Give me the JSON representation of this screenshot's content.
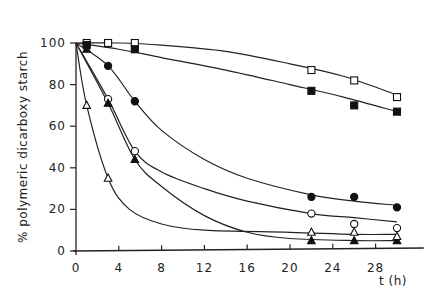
{
  "chart_data": {
    "type": "line",
    "title": "",
    "xlabel": "t (h)",
    "ylabel": "% polymeric dicarboxy starch",
    "xlim": [
      0,
      32
    ],
    "ylim": [
      0,
      100
    ],
    "x_ticks": [
      "0",
      "4",
      "8",
      "12",
      "16",
      "20",
      "24",
      "28"
    ],
    "y_ticks": [
      "0",
      "20",
      "40",
      "60",
      "80",
      "100"
    ],
    "grid": false,
    "legend": "none",
    "series": [
      {
        "name": "open-square",
        "marker": "square-open",
        "x": [
          1,
          3,
          5.5,
          22,
          26,
          30
        ],
        "values": [
          100,
          100,
          100,
          87,
          82,
          74
        ],
        "curve": [
          [
            0,
            100
          ],
          [
            4,
            100
          ],
          [
            8,
            99
          ],
          [
            14,
            96
          ],
          [
            20,
            90
          ],
          [
            25,
            84
          ],
          [
            30,
            75
          ]
        ]
      },
      {
        "name": "filled-square",
        "marker": "square-filled",
        "x": [
          1,
          5.5,
          22,
          26,
          30
        ],
        "values": [
          99,
          97,
          77,
          70,
          67
        ],
        "curve": [
          [
            0,
            100
          ],
          [
            4,
            97
          ],
          [
            8,
            93
          ],
          [
            14,
            87
          ],
          [
            20,
            80
          ],
          [
            25,
            74
          ],
          [
            30,
            67
          ]
        ]
      },
      {
        "name": "filled-circle",
        "marker": "circle-filled",
        "x": [
          3,
          5.5,
          22,
          26,
          30
        ],
        "values": [
          89,
          72,
          26,
          26,
          21
        ],
        "curve": [
          [
            0,
            100
          ],
          [
            3,
            89
          ],
          [
            5.5,
            72
          ],
          [
            8,
            58
          ],
          [
            12,
            44
          ],
          [
            16,
            35
          ],
          [
            22,
            27
          ],
          [
            26,
            24
          ],
          [
            30,
            22
          ]
        ]
      },
      {
        "name": "open-circle",
        "marker": "circle-open",
        "x": [
          3,
          5.5,
          22,
          26,
          30
        ],
        "values": [
          73,
          48,
          18,
          13,
          11
        ],
        "curve": [
          [
            0,
            100
          ],
          [
            3,
            73
          ],
          [
            5.5,
            48
          ],
          [
            8,
            38
          ],
          [
            12,
            30
          ],
          [
            16,
            24
          ],
          [
            22,
            18
          ],
          [
            26,
            16
          ],
          [
            30,
            14
          ]
        ]
      },
      {
        "name": "filled-triangle",
        "marker": "triangle-filled",
        "x": [
          1,
          3,
          5.5,
          22,
          26,
          30
        ],
        "values": [
          97,
          71,
          44,
          5,
          5,
          5
        ],
        "curve": [
          [
            0,
            100
          ],
          [
            3,
            71
          ],
          [
            5.5,
            44
          ],
          [
            8,
            31
          ],
          [
            12,
            17
          ],
          [
            16,
            9
          ],
          [
            20,
            6
          ],
          [
            26,
            5
          ],
          [
            30,
            5
          ]
        ]
      },
      {
        "name": "open-triangle",
        "marker": "triangle-open",
        "x": [
          1,
          3,
          22,
          26,
          30
        ],
        "values": [
          70,
          35,
          9,
          9,
          7
        ],
        "curve": [
          [
            0,
            100
          ],
          [
            1,
            70
          ],
          [
            3,
            35
          ],
          [
            5,
            20
          ],
          [
            8,
            13
          ],
          [
            12,
            10
          ],
          [
            20,
            9
          ],
          [
            26,
            8
          ],
          [
            30,
            8
          ]
        ]
      }
    ]
  }
}
